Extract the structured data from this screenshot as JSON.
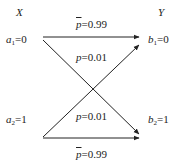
{
  "diagram": {
    "type": "binary-symmetric-channel",
    "input_header": "X",
    "output_header": "Y",
    "inputs": [
      {
        "symbol": "a",
        "index": "1",
        "value": "=0"
      },
      {
        "symbol": "a",
        "index": "2",
        "value": "=1"
      }
    ],
    "outputs": [
      {
        "symbol": "b",
        "index": "1",
        "value": "=0"
      },
      {
        "symbol": "b",
        "index": "2",
        "value": "=1"
      }
    ],
    "edges": [
      {
        "from": "a1",
        "to": "b1",
        "label_var": "p",
        "overline": true,
        "label_value": "=0.99"
      },
      {
        "from": "a1",
        "to": "b2",
        "label_var": "p",
        "overline": false,
        "label_value": "=0.01"
      },
      {
        "from": "a2",
        "to": "b1",
        "label_var": "p",
        "overline": false,
        "label_value": "=0.01"
      },
      {
        "from": "a2",
        "to": "b2",
        "label_var": "p",
        "overline": true,
        "label_value": "=0.99"
      }
    ]
  }
}
